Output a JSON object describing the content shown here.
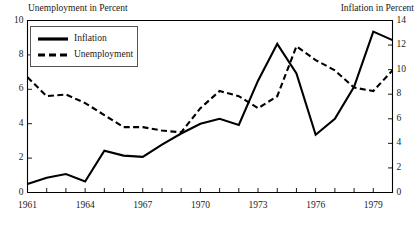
{
  "chart_data": {
    "type": "line",
    "title": "",
    "xlabel": "",
    "left_axis": {
      "label": "Unemployment in Percent",
      "ticks": [
        0,
        2,
        4,
        6,
        8,
        10
      ],
      "range": [
        0,
        10
      ]
    },
    "right_axis": {
      "label": "Inflation in Percent",
      "ticks": [
        0,
        2,
        4,
        6,
        8,
        10,
        12,
        14
      ],
      "range": [
        0,
        14
      ]
    },
    "x": [
      1961,
      1962,
      1963,
      1964,
      1965,
      1966,
      1967,
      1968,
      1969,
      1970,
      1971,
      1972,
      1973,
      1974,
      1975,
      1976,
      1977,
      1978,
      1979,
      1980
    ],
    "xticks_labeled": [
      "1961",
      "1964",
      "1967",
      "1970",
      "1973",
      "1976",
      "1979"
    ],
    "xtick_values": [
      1961,
      1964,
      1967,
      1970,
      1973,
      1976,
      1979
    ],
    "xlim": [
      1961,
      1980
    ],
    "grid": false,
    "legend_position": "top-left",
    "series": [
      {
        "name": "Inflation",
        "axis": "right",
        "style": "solid",
        "color": "#000000",
        "values": [
          0.7,
          1.2,
          1.5,
          0.9,
          3.4,
          3.0,
          2.9,
          3.9,
          4.8,
          5.6,
          6.0,
          5.5,
          9.1,
          12.1,
          9.7,
          4.7,
          6.0,
          8.6,
          13.1,
          12.4
        ]
      },
      {
        "name": "Unemployment",
        "axis": "left",
        "style": "dashed",
        "color": "#000000",
        "values": [
          6.7,
          5.6,
          5.7,
          5.2,
          4.5,
          3.8,
          3.8,
          3.6,
          3.5,
          4.9,
          5.9,
          5.6,
          4.9,
          5.6,
          8.5,
          7.7,
          7.1,
          6.1,
          5.9,
          7.1
        ]
      }
    ]
  },
  "legend": {
    "inflation_label": "Inflation",
    "unemployment_label": "Unemployment"
  }
}
